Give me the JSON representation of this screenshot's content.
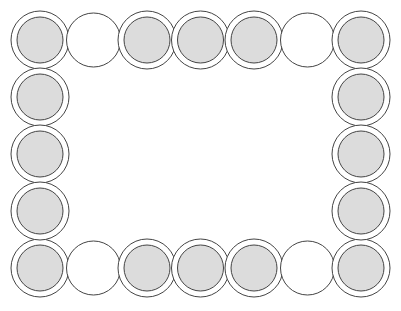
{
  "figure": {
    "colors": {
      "background": "#ffffff",
      "stroke": "#444444",
      "gray_fill": "#dcdcdc",
      "white_fill": "#ffffff"
    },
    "columns_x": [
      40,
      93.5,
      147,
      200.5,
      254,
      307.5,
      361
    ],
    "rows_y": [
      40,
      97,
      154,
      211,
      268
    ],
    "outer_radius": 29,
    "inner_radius": 23,
    "white_radius": 27,
    "top_row": [
      "gray",
      "white",
      "gray",
      "gray",
      "gray",
      "white",
      "gray"
    ],
    "bottom_row": [
      "gray",
      "white",
      "gray",
      "gray",
      "gray",
      "white",
      "gray"
    ],
    "left_column_middle": [
      "gray",
      "gray",
      "gray"
    ],
    "right_column_middle": [
      "gray",
      "gray",
      "gray"
    ]
  }
}
